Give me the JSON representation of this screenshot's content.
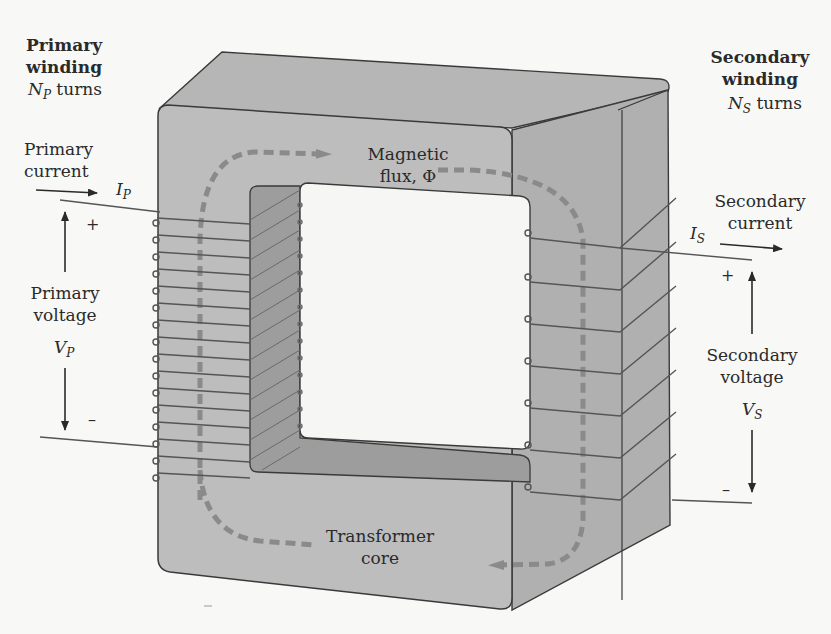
{
  "diagram": {
    "type": "transformer-schematic",
    "colors": {
      "background": "#f8f8f6",
      "core_front": "#bcbcbc",
      "core_top": "#b4b4b4",
      "core_side": "#b0b0b0",
      "window_inner": "#9c9c9c",
      "outline": "#3a3a3a",
      "winding": "#5a5a5a",
      "flux_path": "#8a8a8a",
      "text": "#2a2a2a"
    },
    "labels": {
      "primary_winding": {
        "line1": "Primary",
        "line2": "winding",
        "symbol": "N",
        "subscript": "P",
        "suffix": " turns"
      },
      "secondary_winding": {
        "line1": "Secondary",
        "line2": "winding",
        "symbol": "N",
        "subscript": "S",
        "suffix": " turns"
      },
      "primary_current": {
        "line1": "Primary",
        "line2": "current",
        "symbol": "I",
        "subscript": "P"
      },
      "secondary_current": {
        "line1": "Secondary",
        "line2": "current",
        "symbol": "I",
        "subscript": "S"
      },
      "primary_voltage": {
        "line1": "Primary",
        "line2": "voltage",
        "symbol": "V",
        "subscript": "P",
        "plus": "+",
        "minus": "–"
      },
      "secondary_voltage": {
        "line1": "Secondary",
        "line2": "voltage",
        "symbol": "V",
        "subscript": "S",
        "plus": "+",
        "minus": "–"
      },
      "magnetic_flux": {
        "line1": "Magnetic",
        "line2": "flux, Φ"
      },
      "transformer_core": {
        "line1": "Transformer",
        "line2": "core"
      }
    },
    "windings": {
      "primary_turns_drawn": 16,
      "secondary_turns_drawn": 7
    }
  }
}
